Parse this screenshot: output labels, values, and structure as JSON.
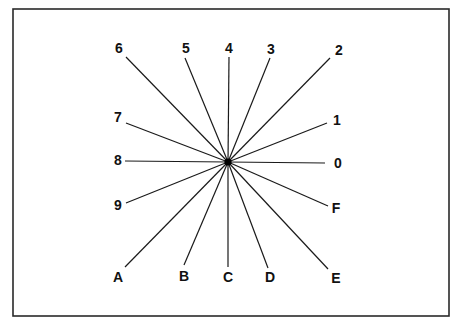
{
  "diagram": {
    "title": "",
    "center": {
      "x": 228,
      "y": 162
    },
    "frame": {
      "x": 13,
      "y": 9,
      "width": 436,
      "height": 307
    },
    "colors": {
      "line": "#1a1a1a",
      "frame": "#2a2a2a",
      "background": "#ffffff",
      "text": "#111111"
    },
    "spokes": [
      {
        "label": "0",
        "end": [
          325,
          163
        ],
        "label_pos": [
          338,
          163
        ]
      },
      {
        "label": "1",
        "end": [
          327,
          123
        ],
        "label_pos": [
          337,
          120
        ]
      },
      {
        "label": "2",
        "end": [
          330,
          58
        ],
        "label_pos": [
          339,
          50
        ]
      },
      {
        "label": "3",
        "end": [
          270,
          58
        ],
        "label_pos": [
          271,
          49
        ]
      },
      {
        "label": "4",
        "end": [
          229,
          57
        ],
        "label_pos": [
          229,
          48
        ]
      },
      {
        "label": "5",
        "end": [
          185,
          58
        ],
        "label_pos": [
          186,
          48
        ]
      },
      {
        "label": "6",
        "end": [
          126,
          57
        ],
        "label_pos": [
          119,
          48
        ]
      },
      {
        "label": "7",
        "end": [
          126,
          123
        ],
        "label_pos": [
          118,
          117
        ]
      },
      {
        "label": "8",
        "end": [
          125,
          161
        ],
        "label_pos": [
          118,
          160
        ]
      },
      {
        "label": "9",
        "end": [
          126,
          203
        ],
        "label_pos": [
          118,
          205
        ]
      },
      {
        "label": "A",
        "end": [
          125,
          267
        ],
        "label_pos": [
          118,
          277
        ]
      },
      {
        "label": "B",
        "end": [
          184,
          265
        ],
        "label_pos": [
          184,
          276
        ]
      },
      {
        "label": "C",
        "end": [
          228,
          267
        ],
        "label_pos": [
          228,
          277
        ]
      },
      {
        "label": "D",
        "end": [
          268,
          268
        ],
        "label_pos": [
          270,
          277
        ]
      },
      {
        "label": "E",
        "end": [
          328,
          269
        ],
        "label_pos": [
          336,
          278
        ]
      },
      {
        "label": "F",
        "end": [
          328,
          206
        ],
        "label_pos": [
          336,
          208
        ]
      }
    ]
  }
}
